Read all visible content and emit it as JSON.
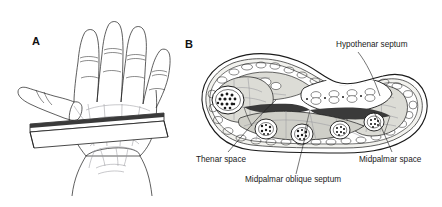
{
  "figure": {
    "type": "anatomical-illustration",
    "background_color": "#ffffff",
    "ink_color": "#1a1a1a",
    "tissue_fill": "#dcdcd6",
    "space_fill": "#3a3a3a"
  },
  "panels": [
    {
      "letter": "A",
      "name": "palmar-view-hand",
      "description": "Palmar view of left hand with cutting plane band across the palm"
    },
    {
      "letter": "B",
      "name": "cross-section-palm",
      "description": "Transverse cross-section of the palm at the level of the cutting plane"
    }
  ],
  "labels": [
    {
      "id": "hypothenar-septum",
      "text": "Hypothenar septum"
    },
    {
      "id": "thenar-space",
      "text": "Thenar space"
    },
    {
      "id": "midpalmar-space",
      "text": "Midpalmar space"
    },
    {
      "id": "midpalmar-oblique-septum",
      "text": "Midpalmar oblique septum"
    }
  ],
  "structures": {
    "flexor_tendon_pairs": 4,
    "metacarpal_bones": 4,
    "thenar_bone": 1,
    "fingers": 4,
    "thumb": 1
  }
}
